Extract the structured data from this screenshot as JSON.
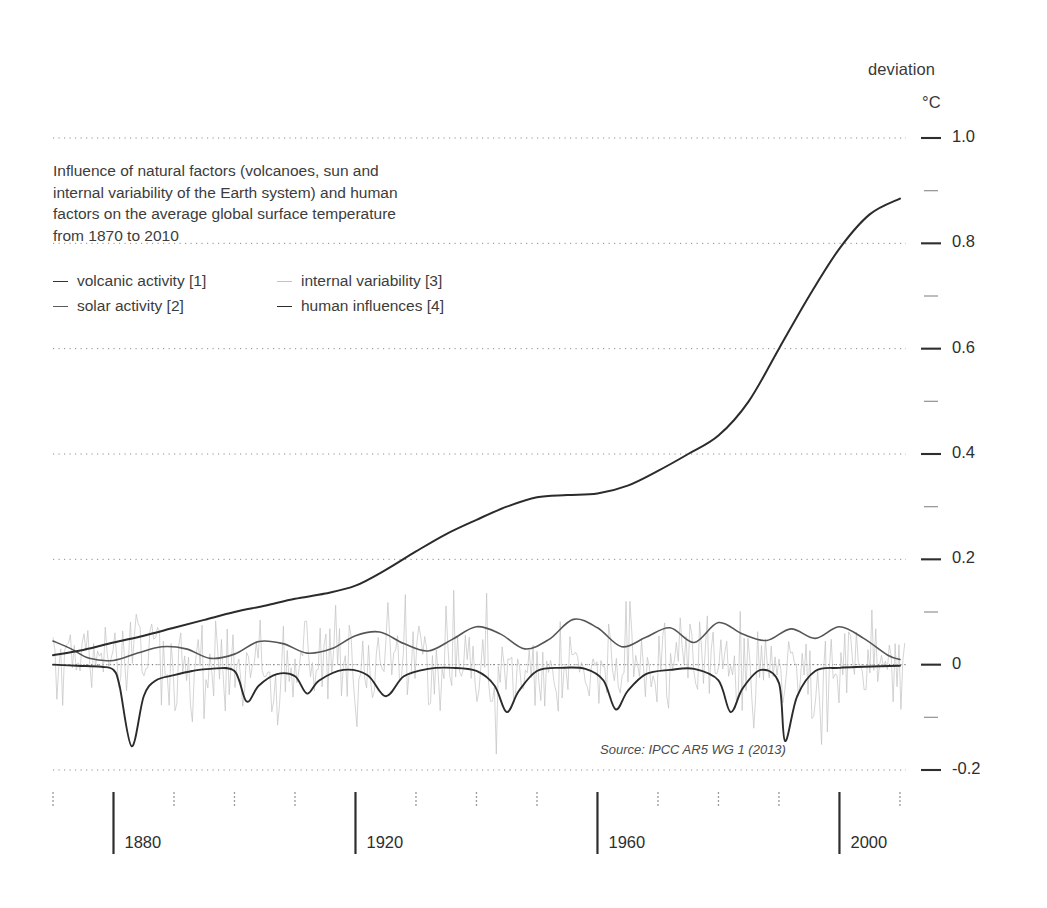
{
  "header": {
    "deviation_label": "deviation",
    "unit_label": "°C"
  },
  "caption": {
    "lines": [
      "Influence of natural factors (volcanoes, sun and",
      "internal variability of the Earth system) and human",
      "factors on the average global surface temperature",
      "from 1870 to 2010"
    ]
  },
  "legend": {
    "items": [
      {
        "label": "volcanic activity [1]",
        "color": "#333333"
      },
      {
        "label": "internal variability [3]",
        "color": "#c2c2c2"
      },
      {
        "label": "solar activity [2]",
        "color": "#5a5a5a"
      },
      {
        "label": "human influences [4]",
        "color": "#2b2b2b"
      }
    ]
  },
  "source": "Source: IPCC AR5 WG 1 (2013)",
  "chart_data": {
    "type": "line",
    "title": "Influence of natural factors (volcanoes, sun and internal variability of the Earth system) and human factors on the average global surface temperature from 1870 to 2010",
    "xlabel": "",
    "ylabel": "deviation °C",
    "xlim": [
      1870,
      2011
    ],
    "ylim": [
      -0.2,
      1.0
    ],
    "grid": true,
    "gridlines_y": [
      1.0,
      0.8,
      0.6,
      0.4,
      0.2,
      0.0,
      -0.2
    ],
    "zero_line": 0.0,
    "legend_position": "upper-left",
    "yticks_major": [
      "1.0",
      "0.8",
      "0.6",
      "0.4",
      "0.2",
      "0",
      "-0.2"
    ],
    "ytick_values": [
      1.0,
      0.8,
      0.6,
      0.4,
      0.2,
      0.0,
      -0.2
    ],
    "yticks_minor": [
      0.9,
      0.7,
      0.5,
      0.3,
      0.1,
      -0.1
    ],
    "xticks_major": [
      "1880",
      "1920",
      "1960",
      "2000"
    ],
    "xtick_major_values": [
      1880,
      1920,
      1960,
      2000
    ],
    "xticks_minor_values": [
      1870,
      1890,
      1900,
      1910,
      1930,
      1940,
      1950,
      1970,
      1980,
      1990,
      2010
    ],
    "series": [
      {
        "name": "human influences [4]",
        "color": "#2b2b2b",
        "width": 2.0,
        "x": [
          1870,
          1875,
          1880,
          1885,
          1890,
          1895,
          1900,
          1905,
          1910,
          1915,
          1920,
          1925,
          1930,
          1935,
          1940,
          1945,
          1950,
          1955,
          1960,
          1965,
          1970,
          1975,
          1980,
          1985,
          1990,
          1995,
          2000,
          2005,
          2010
        ],
        "values": [
          0.018,
          0.028,
          0.042,
          0.055,
          0.07,
          0.085,
          0.1,
          0.112,
          0.125,
          0.135,
          0.15,
          0.18,
          0.215,
          0.248,
          0.275,
          0.3,
          0.318,
          0.322,
          0.325,
          0.34,
          0.368,
          0.4,
          0.435,
          0.5,
          0.6,
          0.7,
          0.79,
          0.855,
          0.885
        ]
      },
      {
        "name": "solar activity [2]",
        "color": "#555555",
        "width": 1.6,
        "x": [
          1870,
          1873,
          1876,
          1880,
          1884,
          1888,
          1892,
          1896,
          1900,
          1904,
          1908,
          1912,
          1916,
          1920,
          1924,
          1928,
          1932,
          1936,
          1940,
          1944,
          1948,
          1952,
          1956,
          1960,
          1964,
          1968,
          1972,
          1976,
          1980,
          1984,
          1988,
          1992,
          1996,
          2000,
          2004,
          2008,
          2010
        ],
        "values": [
          0.045,
          0.03,
          0.012,
          0.008,
          0.022,
          0.034,
          0.03,
          0.012,
          0.02,
          0.044,
          0.04,
          0.022,
          0.03,
          0.055,
          0.062,
          0.04,
          0.026,
          0.048,
          0.072,
          0.058,
          0.03,
          0.048,
          0.086,
          0.07,
          0.034,
          0.052,
          0.07,
          0.042,
          0.08,
          0.058,
          0.046,
          0.068,
          0.05,
          0.072,
          0.05,
          0.018,
          0.01
        ]
      },
      {
        "name": "volcanic activity [1]",
        "color": "#2b2b2b",
        "width": 1.9,
        "note": "near zero with deep negative spikes at major eruptions",
        "eruptions": [
          {
            "year": 1883,
            "depth": -0.155,
            "name": "Krakatoa"
          },
          {
            "year": 1902,
            "depth": -0.07
          },
          {
            "year": 1912,
            "depth": -0.055
          },
          {
            "year": 1925,
            "depth": -0.06
          },
          {
            "year": 1945,
            "depth": -0.09
          },
          {
            "year": 1963,
            "depth": -0.085,
            "name": "Agung"
          },
          {
            "year": 1982,
            "depth": -0.09,
            "name": "El Chichon"
          },
          {
            "year": 1991,
            "depth": -0.145,
            "name": "Pinatubo"
          }
        ],
        "x": [
          1870,
          1874,
          1878,
          1880,
          1881,
          1883,
          1885,
          1887,
          1890,
          1893,
          1896,
          1900,
          1902,
          1904,
          1907,
          1910,
          1912,
          1914,
          1918,
          1922,
          1925,
          1928,
          1932,
          1936,
          1940,
          1943,
          1945,
          1947,
          1950,
          1954,
          1958,
          1961,
          1963,
          1965,
          1968,
          1972,
          1976,
          1980,
          1982,
          1984,
          1987,
          1990,
          1991,
          1993,
          1996,
          2000,
          2004,
          2010
        ],
        "values": [
          0.0,
          -0.002,
          -0.004,
          -0.01,
          -0.04,
          -0.155,
          -0.06,
          -0.03,
          -0.02,
          -0.012,
          -0.008,
          -0.012,
          -0.07,
          -0.04,
          -0.018,
          -0.022,
          -0.055,
          -0.03,
          -0.01,
          -0.02,
          -0.06,
          -0.022,
          -0.008,
          -0.006,
          -0.012,
          -0.04,
          -0.09,
          -0.05,
          -0.012,
          -0.006,
          -0.008,
          -0.03,
          -0.085,
          -0.05,
          -0.018,
          -0.01,
          -0.008,
          -0.03,
          -0.09,
          -0.045,
          -0.01,
          -0.035,
          -0.145,
          -0.06,
          -0.012,
          -0.006,
          -0.004,
          -0.002
        ]
      },
      {
        "name": "internal variability [3]",
        "color": "#c2c2c2",
        "width": 0.7,
        "note": "high-frequency noise band, roughly +/- 0.12 around zero, full record 1870-2010"
      }
    ]
  }
}
